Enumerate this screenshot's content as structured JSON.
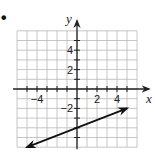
{
  "bullet": "•",
  "chart_data": {
    "type": "line",
    "title": "",
    "xlabel": "x",
    "ylabel": "y",
    "xlim": [
      -6,
      6
    ],
    "ylim": [
      -6,
      6
    ],
    "grid": true,
    "grid_step": 1,
    "x_tick_labels": [
      {
        "value": -4,
        "label": "−4"
      },
      {
        "value": 2,
        "label": "2"
      },
      {
        "value": 4,
        "label": "4"
      }
    ],
    "y_tick_labels": [
      {
        "value": 4,
        "label": "4"
      },
      {
        "value": 2,
        "label": "2"
      },
      {
        "value": -2,
        "label": "−2"
      }
    ],
    "series": [
      {
        "name": "line",
        "equation": "y = (2/5)x − 4",
        "slope": 0.4,
        "intercept": -4,
        "x": [
          -5,
          5
        ],
        "y": [
          -6,
          -2
        ],
        "arrows": "both"
      }
    ]
  },
  "colors": {
    "grid": "#b8b8b8",
    "axis": "#222222",
    "line": "#111111"
  }
}
